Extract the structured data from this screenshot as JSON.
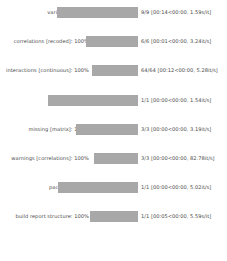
{
  "theme": {
    "background": "#ffffff",
    "bar_fill": "#a8a8a8",
    "text": "#4a4a4a"
  },
  "progress": {
    "rows": [
      {
        "task": "variables",
        "label": "variables: 100%",
        "percent": 100,
        "bar_start_x": 57,
        "bar_end_x": 138,
        "stats": "9/9 [00:14<00:00,  1.59s/it]",
        "completed": 9,
        "total": 9,
        "elapsed": "00:14",
        "remaining": "00:00",
        "rate": "1.59s/it"
      },
      {
        "task": "correlations [recoded]",
        "label": "correlations [recoded]: 100%",
        "percent": 100,
        "bar_start_x": 86,
        "bar_end_x": 138,
        "stats": "6/6 [00:01<00:00,  3.24it/s]",
        "completed": 6,
        "total": 6,
        "elapsed": "00:01",
        "remaining": "00:00",
        "rate": "3.24it/s"
      },
      {
        "task": "interactions [continuous]",
        "label": "interactions [continuous]: 100%",
        "percent": 100,
        "bar_start_x": 92,
        "bar_end_x": 138,
        "stats": "64/64 [00:12<00:00,  5.28it/s]",
        "completed": 64,
        "total": 64,
        "elapsed": "00:12",
        "remaining": "00:00",
        "rate": "5.28it/s"
      },
      {
        "task": "table",
        "label": "table: 100%",
        "percent": 100,
        "bar_start_x": 48,
        "bar_end_x": 138,
        "stats": "1/1 [00:00<00:00,  1.54it/s]",
        "completed": 1,
        "total": 1,
        "elapsed": "00:00",
        "remaining": "00:00",
        "rate": "1.54it/s"
      },
      {
        "task": "missing [matrix]",
        "label": "missing [matrix]: 100%",
        "percent": 100,
        "bar_start_x": 76,
        "bar_end_x": 138,
        "stats": "3/3 [00:00<00:00,  3.19it/s]",
        "completed": 3,
        "total": 3,
        "elapsed": "00:00",
        "remaining": "00:00",
        "rate": "3.19it/s"
      },
      {
        "task": "warnings [correlations]",
        "label": "warnings [correlations]: 100%",
        "percent": 100,
        "bar_start_x": 94,
        "bar_end_x": 138,
        "stats": "3/3 [00:00<00:00, 82.78it/s]",
        "completed": 3,
        "total": 3,
        "elapsed": "00:00",
        "remaining": "00:00",
        "rate": "82.78it/s"
      },
      {
        "task": "package",
        "label": "package: 100%",
        "percent": 100,
        "bar_start_x": 58,
        "bar_end_x": 138,
        "stats": "1/1 [00:00<00:00,  5.02it/s]",
        "completed": 1,
        "total": 1,
        "elapsed": "00:00",
        "remaining": "00:00",
        "rate": "5.02it/s"
      },
      {
        "task": "build report structure",
        "label": "build report structure: 100%",
        "percent": 100,
        "bar_start_x": 90,
        "bar_end_x": 138,
        "stats": "1/1 [00:05<00:00,  5.59s/it]",
        "completed": 1,
        "total": 1,
        "elapsed": "00:05",
        "remaining": "00:00",
        "rate": "5.59s/it"
      }
    ]
  }
}
